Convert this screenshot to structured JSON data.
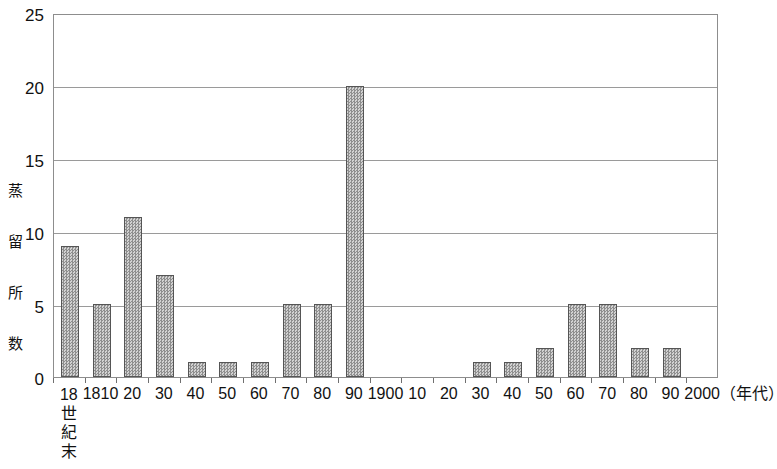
{
  "chart_data": {
    "type": "bar",
    "title": "",
    "subtitle": "",
    "xlabel": "（年代）",
    "ylabel": "蒸留所数",
    "categories": [
      "18世紀末",
      "1810",
      "20",
      "30",
      "40",
      "50",
      "60",
      "70",
      "80",
      "90",
      "1900",
      "10",
      "20",
      "30",
      "40",
      "50",
      "60",
      "70",
      "80",
      "90",
      "2000"
    ],
    "values": [
      9,
      5,
      11,
      7,
      1,
      1,
      1,
      5,
      5,
      20,
      0,
      0,
      0,
      1,
      1,
      2,
      5,
      5,
      2,
      2,
      0
    ],
    "ylim": [
      0,
      25
    ],
    "ytick_labels": [
      "0",
      "5",
      "10",
      "15",
      "20",
      "25"
    ],
    "ytick_values": [
      0,
      5,
      10,
      15,
      20,
      25
    ],
    "grid": true,
    "legend": "none",
    "bar_color": "#b6b6b6",
    "bar_border_color": "#555555",
    "axis_color": "#8d8d8d",
    "grid_color": "#9a9a9a"
  },
  "axis": {
    "y_title_chars": [
      "蒸",
      "留",
      "所",
      "数"
    ],
    "x_unit_label": "（年代）",
    "first_category_lines": [
      "18",
      "世",
      "紀",
      "末"
    ]
  }
}
